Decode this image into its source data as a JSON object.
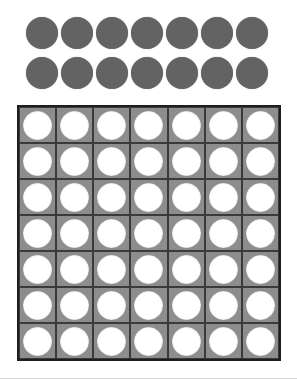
{
  "game": {
    "type": "connect-four",
    "columns": 7,
    "rows": 7,
    "colors": {
      "disc": "#636363",
      "board": "#8d8d8d",
      "board_border": "#1e1e1e",
      "hole": "#ffffff",
      "background": "#ffffff"
    }
  },
  "tray": {
    "rows": [
      {
        "discs": 7
      },
      {
        "discs": 7
      }
    ]
  },
  "board": {
    "cells": [
      [
        "empty",
        "empty",
        "empty",
        "empty",
        "empty",
        "empty",
        "empty"
      ],
      [
        "empty",
        "empty",
        "empty",
        "empty",
        "empty",
        "empty",
        "empty"
      ],
      [
        "empty",
        "empty",
        "empty",
        "empty",
        "empty",
        "empty",
        "empty"
      ],
      [
        "empty",
        "empty",
        "empty",
        "empty",
        "empty",
        "empty",
        "empty"
      ],
      [
        "empty",
        "empty",
        "empty",
        "empty",
        "empty",
        "empty",
        "empty"
      ],
      [
        "empty",
        "empty",
        "empty",
        "empty",
        "empty",
        "empty",
        "empty"
      ],
      [
        "empty",
        "empty",
        "empty",
        "empty",
        "empty",
        "empty",
        "empty"
      ]
    ]
  }
}
